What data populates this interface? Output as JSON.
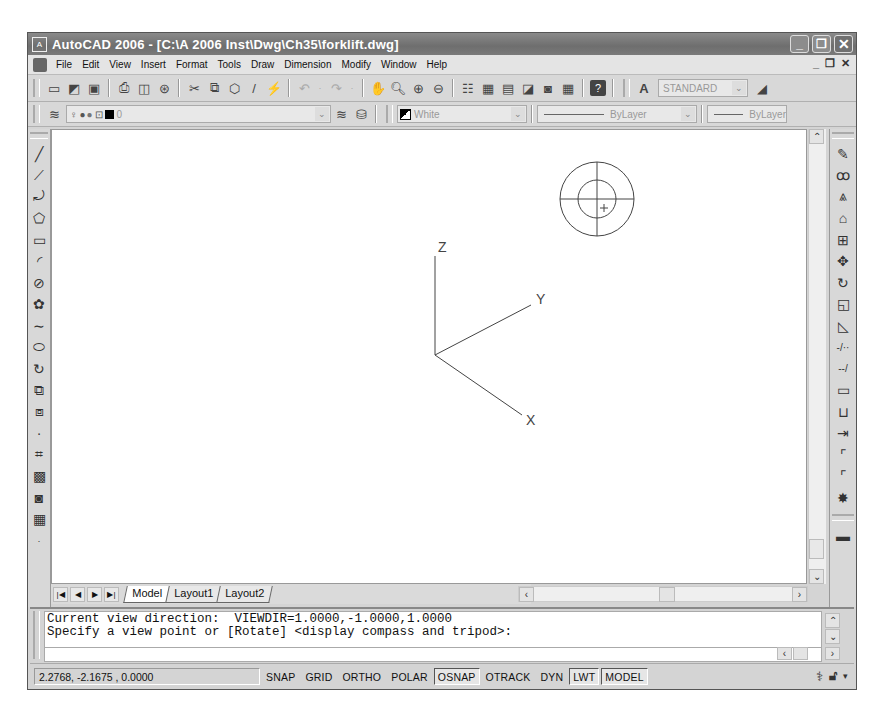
{
  "window": {
    "title": "AutoCAD 2006 - [C:\\A 2006 Inst\\Dwg\\Ch35\\forklift.dwg]",
    "controls": {
      "minimize": "_",
      "restore": "❐",
      "close": "✕"
    }
  },
  "menubar": {
    "items": [
      "File",
      "Edit",
      "View",
      "Insert",
      "Format",
      "Tools",
      "Draw",
      "Dimension",
      "Modify",
      "Window",
      "Help"
    ],
    "mdi_controls": {
      "minimize": "_",
      "restore": "❐",
      "close": "✕"
    }
  },
  "standard_toolbar": {
    "icons": [
      "new-icon",
      "open-icon",
      "save-icon",
      "plot-icon",
      "plot-preview-icon",
      "publish-icon",
      "cut-icon",
      "copy-icon",
      "paste-icon",
      "match-properties-icon",
      "block-editor-icon",
      "undo-icon",
      "redo-icon",
      "pan-icon",
      "zoom-realtime-icon",
      "zoom-window-icon",
      "zoom-previous-icon",
      "properties-icon",
      "design-center-icon",
      "tool-palettes-icon",
      "sheet-set-icon",
      "markup-icon",
      "quickcalc-icon",
      "help-icon"
    ],
    "text_style_value": "STANDARD"
  },
  "layers_toolbar": {
    "layer_value": "0",
    "color_value": "White",
    "linetype_value": "ByLayer",
    "lineweight_value": "ByLayer"
  },
  "draw_toolbar": {
    "tools": [
      "line",
      "construction-line",
      "polyline",
      "polygon",
      "rectangle",
      "arc",
      "circle",
      "revision-cloud",
      "spline",
      "ellipse",
      "ellipse-arc",
      "insert-block",
      "make-block",
      "point",
      "hatch",
      "gradient",
      "region",
      "table",
      "multiline-text"
    ]
  },
  "modify_toolbar": {
    "tools": [
      "erase",
      "copy",
      "mirror",
      "offset",
      "array",
      "move",
      "rotate",
      "scale",
      "stretch",
      "trim",
      "extend",
      "break-at-point",
      "break",
      "join",
      "chamfer",
      "fillet",
      "explode"
    ]
  },
  "viewport": {
    "tripod": {
      "z_label": "Z",
      "y_label": "Y",
      "x_label": "X"
    },
    "compass": "display-compass"
  },
  "layout_tabs": {
    "tabs": [
      {
        "label": "Model",
        "active": true
      },
      {
        "label": "Layout1",
        "active": false
      },
      {
        "label": "Layout2",
        "active": false
      }
    ]
  },
  "command_line": {
    "lines": [
      "Current view direction:  VIEWDIR=1.0000,-1.0000,1.0000",
      "Specify a view point or [Rotate] <display compass and tripod>:"
    ],
    "input_value": ""
  },
  "status_bar": {
    "coordinates": "2.2768,  -2.1675 , 0.0000",
    "toggles": [
      {
        "label": "SNAP",
        "on": false
      },
      {
        "label": "GRID",
        "on": false
      },
      {
        "label": "ORTHO",
        "on": false
      },
      {
        "label": "POLAR",
        "on": false
      },
      {
        "label": "OSNAP",
        "on": true
      },
      {
        "label": "OTRACK",
        "on": false
      },
      {
        "label": "DYN",
        "on": false
      },
      {
        "label": "LWT",
        "on": true
      },
      {
        "label": "MODEL",
        "on": true
      }
    ]
  }
}
